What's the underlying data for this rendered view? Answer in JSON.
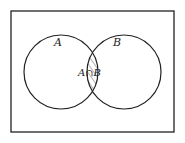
{
  "diagram": {
    "type": "venn",
    "universe": {
      "x": 11,
      "y": 11,
      "width": 163,
      "height": 121
    },
    "sets": [
      {
        "label": "A",
        "cx": 61,
        "cy": 72,
        "r": 37
      },
      {
        "label": "B",
        "cx": 124,
        "cy": 72,
        "r": 37
      }
    ],
    "intersection": {
      "label": "A∩B",
      "fill": "hatched"
    },
    "colors": {
      "stroke": "#222222",
      "background": "#ffffff"
    }
  }
}
